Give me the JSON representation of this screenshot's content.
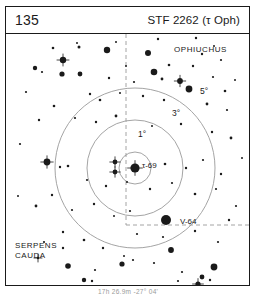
{
  "header": {
    "page_number": "135",
    "title": "STF 2262 (τ Oph)"
  },
  "caption": "17h 26.9m  -27° 04'",
  "constellations": [
    {
      "name": "OPHIUCHUS",
      "x": 168,
      "y": 11
    },
    {
      "name": "SERPENS\nCAUDA",
      "x": 9,
      "y": 207
    }
  ],
  "ring_labels": {
    "one_deg": "1°",
    "three_deg": "3°",
    "five_deg": "5°"
  },
  "star_labels": {
    "primary": "τ-69",
    "secondary": "V-64"
  },
  "colors": {
    "ink": "#1a1a1a",
    "ring": "#9a9a9a",
    "grid": "#9a9a9a",
    "paper": "#ffffff"
  },
  "chart_data": {
    "type": "scatter",
    "title": "STF 2262 (τ Oph)",
    "xlabel": "",
    "ylabel": "",
    "grid": true,
    "legend": "none",
    "field_width": 243,
    "field_height": 251,
    "center": {
      "x": 129,
      "y": 134
    },
    "rings": [
      {
        "label": "1°",
        "radius": 16
      },
      {
        "label": "3°",
        "radius": 48
      },
      {
        "label": "5°",
        "radius": 80
      }
    ],
    "grid_lines": [
      {
        "orientation": "vertical",
        "x": 120,
        "y1": 0,
        "y2": 191,
        "style": "dashed"
      },
      {
        "orientation": "horizontal",
        "y": 191,
        "x1": 120,
        "x2": 243,
        "style": "dashed"
      }
    ],
    "stars": [
      {
        "x": 110,
        "y": 8,
        "r": 1.0,
        "mark": "none"
      },
      {
        "x": 152,
        "y": 5,
        "r": 1.2,
        "mark": "none"
      },
      {
        "x": 190,
        "y": 4,
        "r": 1.2,
        "mark": "none"
      },
      {
        "x": 208,
        "y": 12,
        "r": 1.0,
        "mark": "none"
      },
      {
        "x": 47,
        "y": 14,
        "r": 1.3,
        "mark": "none"
      },
      {
        "x": 71,
        "y": 9,
        "r": 1.0,
        "mark": "none"
      },
      {
        "x": 73,
        "y": 13,
        "r": 1.5,
        "mark": "none"
      },
      {
        "x": 101,
        "y": 16,
        "r": 3.2,
        "mark": "none"
      },
      {
        "x": 142,
        "y": 19,
        "r": 3.0,
        "mark": "none"
      },
      {
        "x": 196,
        "y": 20,
        "r": 1.2,
        "mark": "none"
      },
      {
        "x": 215,
        "y": 26,
        "r": 1.1,
        "mark": "none"
      },
      {
        "x": 57,
        "y": 26,
        "r": 3.2,
        "mark": "cross"
      },
      {
        "x": 29,
        "y": 34,
        "r": 2.2,
        "mark": "none"
      },
      {
        "x": 36,
        "y": 38,
        "r": 1.1,
        "mark": "none"
      },
      {
        "x": 56,
        "y": 40,
        "r": 2.6,
        "mark": "none"
      },
      {
        "x": 74,
        "y": 40,
        "r": 2.4,
        "mark": "none"
      },
      {
        "x": 148,
        "y": 38,
        "r": 3.3,
        "mark": "none"
      },
      {
        "x": 156,
        "y": 45,
        "r": 1.4,
        "mark": "none"
      },
      {
        "x": 163,
        "y": 31,
        "r": 1.3,
        "mark": "none"
      },
      {
        "x": 187,
        "y": 32,
        "r": 1.2,
        "mark": "none"
      },
      {
        "x": 207,
        "y": 43,
        "r": 1.1,
        "mark": "none"
      },
      {
        "x": 120,
        "y": 32,
        "r": 1.0,
        "mark": "none"
      },
      {
        "x": 103,
        "y": 44,
        "r": 1.2,
        "mark": "none"
      },
      {
        "x": 128,
        "y": 48,
        "r": 1.1,
        "mark": "none"
      },
      {
        "x": 174,
        "y": 47,
        "r": 2.9,
        "mark": "cross"
      },
      {
        "x": 183,
        "y": 55,
        "r": 3.4,
        "mark": "none"
      },
      {
        "x": 219,
        "y": 57,
        "r": 1.3,
        "mark": "none"
      },
      {
        "x": 229,
        "y": 46,
        "r": 1.0,
        "mark": "none"
      },
      {
        "x": 84,
        "y": 60,
        "r": 1.2,
        "mark": "none"
      },
      {
        "x": 94,
        "y": 66,
        "r": 1.3,
        "mark": "none"
      },
      {
        "x": 114,
        "y": 59,
        "r": 1.0,
        "mark": "none"
      },
      {
        "x": 137,
        "y": 62,
        "r": 1.2,
        "mark": "none"
      },
      {
        "x": 158,
        "y": 66,
        "r": 1.2,
        "mark": "none"
      },
      {
        "x": 201,
        "y": 70,
        "r": 1.4,
        "mark": "none"
      },
      {
        "x": 221,
        "y": 76,
        "r": 1.1,
        "mark": "none"
      },
      {
        "x": 48,
        "y": 72,
        "r": 1.3,
        "mark": "none"
      },
      {
        "x": 33,
        "y": 86,
        "r": 1.2,
        "mark": "none"
      },
      {
        "x": 69,
        "y": 84,
        "r": 1.1,
        "mark": "none"
      },
      {
        "x": 90,
        "y": 88,
        "r": 1.2,
        "mark": "none"
      },
      {
        "x": 110,
        "y": 82,
        "r": 1.4,
        "mark": "none"
      },
      {
        "x": 146,
        "y": 92,
        "r": 1.0,
        "mark": "none"
      },
      {
        "x": 175,
        "y": 90,
        "r": 1.2,
        "mark": "none"
      },
      {
        "x": 206,
        "y": 98,
        "r": 1.2,
        "mark": "none"
      },
      {
        "x": 225,
        "y": 104,
        "r": 1.4,
        "mark": "none"
      },
      {
        "x": 109,
        "y": 128,
        "r": 2.4,
        "mark": "cross"
      },
      {
        "x": 109,
        "y": 138,
        "r": 2.4,
        "mark": "cross"
      },
      {
        "x": 129,
        "y": 134,
        "r": 4.6,
        "mark": "cross"
      },
      {
        "x": 159,
        "y": 130,
        "r": 1.3,
        "mark": "none"
      },
      {
        "x": 180,
        "y": 134,
        "r": 1.2,
        "mark": "none"
      },
      {
        "x": 197,
        "y": 126,
        "r": 1.1,
        "mark": "none"
      },
      {
        "x": 215,
        "y": 140,
        "r": 1.2,
        "mark": "none"
      },
      {
        "x": 62,
        "y": 132,
        "r": 1.3,
        "mark": "none"
      },
      {
        "x": 41,
        "y": 128,
        "r": 3.4,
        "mark": "cross"
      },
      {
        "x": 54,
        "y": 133,
        "r": 1.2,
        "mark": "none"
      },
      {
        "x": 81,
        "y": 146,
        "r": 1.1,
        "mark": "none"
      },
      {
        "x": 100,
        "y": 152,
        "r": 1.2,
        "mark": "none"
      },
      {
        "x": 121,
        "y": 148,
        "r": 1.0,
        "mark": "none"
      },
      {
        "x": 144,
        "y": 155,
        "r": 1.2,
        "mark": "none"
      },
      {
        "x": 166,
        "y": 149,
        "r": 1.1,
        "mark": "none"
      },
      {
        "x": 189,
        "y": 160,
        "r": 1.3,
        "mark": "none"
      },
      {
        "x": 210,
        "y": 155,
        "r": 1.1,
        "mark": "none"
      },
      {
        "x": 46,
        "y": 161,
        "r": 1.2,
        "mark": "none"
      },
      {
        "x": 30,
        "y": 172,
        "r": 1.4,
        "mark": "none"
      },
      {
        "x": 66,
        "y": 176,
        "r": 1.1,
        "mark": "none"
      },
      {
        "x": 88,
        "y": 170,
        "r": 1.2,
        "mark": "none"
      },
      {
        "x": 108,
        "y": 182,
        "r": 1.0,
        "mark": "none"
      },
      {
        "x": 160,
        "y": 186,
        "r": 5.0,
        "mark": "none"
      },
      {
        "x": 124,
        "y": 177,
        "r": 1.1,
        "mark": "none"
      },
      {
        "x": 223,
        "y": 186,
        "r": 1.2,
        "mark": "none"
      },
      {
        "x": 131,
        "y": 200,
        "r": 1.1,
        "mark": "none"
      },
      {
        "x": 157,
        "y": 203,
        "r": 1.1,
        "mark": "none"
      },
      {
        "x": 189,
        "y": 197,
        "r": 1.2,
        "mark": "none"
      },
      {
        "x": 212,
        "y": 208,
        "r": 1.1,
        "mark": "none"
      },
      {
        "x": 57,
        "y": 198,
        "r": 1.2,
        "mark": "none"
      },
      {
        "x": 38,
        "y": 208,
        "r": 1.1,
        "mark": "none"
      },
      {
        "x": 78,
        "y": 206,
        "r": 1.3,
        "mark": "none"
      },
      {
        "x": 97,
        "y": 214,
        "r": 1.2,
        "mark": "none"
      },
      {
        "x": 165,
        "y": 216,
        "r": 2.9,
        "mark": "none"
      },
      {
        "x": 118,
        "y": 222,
        "r": 1.0,
        "mark": "none"
      },
      {
        "x": 148,
        "y": 229,
        "r": 1.1,
        "mark": "none"
      },
      {
        "x": 176,
        "y": 238,
        "r": 1.1,
        "mark": "none"
      },
      {
        "x": 208,
        "y": 233,
        "r": 3.4,
        "mark": "none"
      },
      {
        "x": 32,
        "y": 224,
        "r": 1.2,
        "mark": "cross"
      },
      {
        "x": 62,
        "y": 232,
        "r": 2.8,
        "mark": "none"
      },
      {
        "x": 89,
        "y": 236,
        "r": 1.1,
        "mark": "none"
      },
      {
        "x": 116,
        "y": 230,
        "r": 2.6,
        "mark": "none"
      },
      {
        "x": 127,
        "y": 226,
        "r": 1.1,
        "mark": "none"
      },
      {
        "x": 196,
        "y": 243,
        "r": 2.4,
        "mark": "none"
      },
      {
        "x": 204,
        "y": 246,
        "r": 1.2,
        "mark": "none"
      },
      {
        "x": 78,
        "y": 246,
        "r": 2.2,
        "mark": "none"
      },
      {
        "x": 86,
        "y": 247,
        "r": 1.2,
        "mark": "none"
      },
      {
        "x": 172,
        "y": 247,
        "r": 1.1,
        "mark": "none"
      },
      {
        "x": 192,
        "y": 250,
        "r": 2.6,
        "mark": "cross"
      },
      {
        "x": 57,
        "y": 214,
        "r": 1.2,
        "mark": "none"
      },
      {
        "x": 230,
        "y": 172,
        "r": 1.1,
        "mark": "none"
      },
      {
        "x": 236,
        "y": 124,
        "r": 1.0,
        "mark": "none"
      },
      {
        "x": 14,
        "y": 110,
        "r": 1.1,
        "mark": "none"
      },
      {
        "x": 12,
        "y": 162,
        "r": 1.0,
        "mark": "none"
      },
      {
        "x": 20,
        "y": 58,
        "r": 1.1,
        "mark": "none"
      }
    ]
  }
}
